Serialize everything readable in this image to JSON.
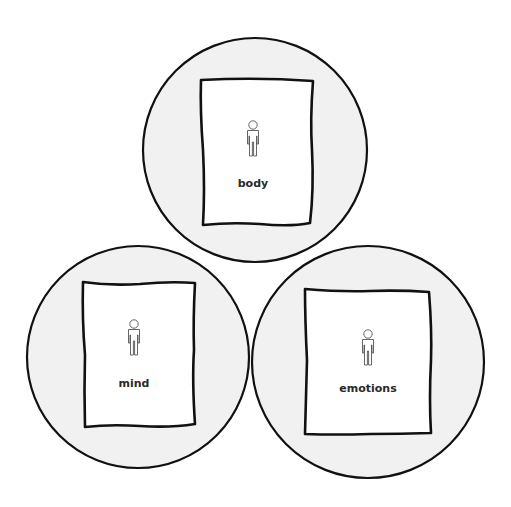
{
  "diagram": {
    "background": "#ffffff",
    "circle_fill": "#f1f1f1",
    "stroke_color": "#111111",
    "nodes": [
      {
        "id": "body",
        "label": "body",
        "icon": "person-icon",
        "circle": {
          "cx": 255,
          "cy": 150,
          "r": 112
        },
        "rect": {
          "x1": 201,
          "y1": 79,
          "x2": 313,
          "y2": 226
        },
        "icon_pos": {
          "x": 253,
          "y": 124
        },
        "label_pos": {
          "x": 253,
          "y": 184
        }
      },
      {
        "id": "mind",
        "label": "mind",
        "icon": "person-icon",
        "circle": {
          "cx": 138,
          "cy": 357,
          "r": 111
        },
        "rect": {
          "x1": 83,
          "y1": 282,
          "x2": 195,
          "y2": 427
        },
        "icon_pos": {
          "x": 134,
          "y": 323
        },
        "label_pos": {
          "x": 134,
          "y": 384
        }
      },
      {
        "id": "emotions",
        "label": "emotions",
        "icon": "person-icon",
        "circle": {
          "cx": 368,
          "cy": 362,
          "r": 116
        },
        "rect": {
          "x1": 304,
          "y1": 289,
          "x2": 432,
          "y2": 435
        },
        "icon_pos": {
          "x": 368,
          "y": 333
        },
        "label_pos": {
          "x": 368,
          "y": 393
        }
      }
    ]
  }
}
